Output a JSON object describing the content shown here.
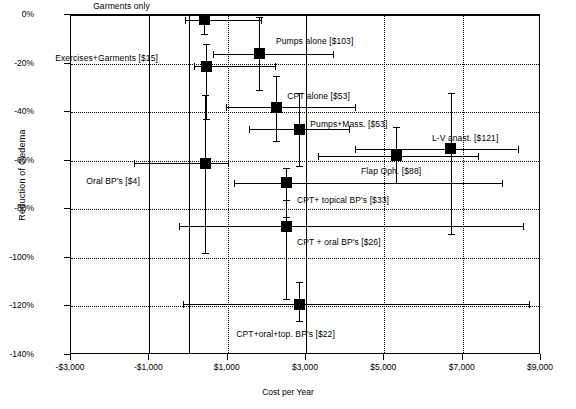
{
  "chart_data": {
    "type": "scatter",
    "title": "",
    "xlabel": "Cost per Year",
    "ylabel": "Reduction of Oedema",
    "xlim": [
      -3000,
      9000
    ],
    "ylim": [
      -140,
      0
    ],
    "grid": true,
    "legend": "none",
    "xticks": [
      "-$3,000",
      "-$1,000",
      "$1,000",
      "$3,000",
      "$5,000",
      "$7,000",
      "$9,000"
    ],
    "xtick_values": [
      -3000,
      -1000,
      1000,
      3000,
      5000,
      7000,
      9000
    ],
    "yticks": [
      "0%",
      "-20%",
      "-40%",
      "-60%",
      "-80%",
      "-100%",
      "-120%",
      "-140%"
    ],
    "ytick_values": [
      0,
      -20,
      -40,
      -60,
      -80,
      -100,
      -120,
      -140
    ],
    "points": [
      {
        "label": "Garments only",
        "cost": 400,
        "reduction": -2,
        "x_low": -100,
        "x_high": 1850,
        "y_low": -8,
        "y_high": 4
      },
      {
        "label": "Pumps alone [$103]",
        "cost": 1800,
        "reduction": -16,
        "x_low": 620,
        "x_high": 3700,
        "y_low": -31,
        "y_high": -1
      },
      {
        "label": "Exercises+Garments [$15]",
        "cost": 450,
        "reduction": -21,
        "x_low": 130,
        "x_high": 2200,
        "y_low": -43,
        "y_high": -12
      },
      {
        "label": "CPT alone [$53]",
        "cost": 2240,
        "reduction": -38,
        "x_low": 950,
        "x_high": 4250,
        "y_low": -52,
        "y_high": -25
      },
      {
        "label": "Pumps+Mass. [$53]",
        "cost": 2830,
        "reduction": -47,
        "x_low": 1550,
        "x_high": 4100,
        "y_low": -62,
        "y_high": -32
      },
      {
        "label": "L-V anast. [$121]",
        "cost": 6700,
        "reduction": -55,
        "x_low": 4250,
        "x_high": 8400,
        "y_low": -90,
        "y_high": -32
      },
      {
        "label": "Flap Oph. [$88]",
        "cost": 5300,
        "reduction": -58,
        "x_low": 3300,
        "x_high": 7400,
        "y_low": -69,
        "y_high": -46
      },
      {
        "label": "Oral BP's [$4]",
        "cost": 430,
        "reduction": -61,
        "x_low": -1400,
        "x_high": 1000,
        "y_low": -98,
        "y_high": -33
      },
      {
        "label": "CPT+ topical BP's [$33]",
        "cost": 2490,
        "reduction": -69,
        "x_low": 1150,
        "x_high": 8000,
        "y_low": -83,
        "y_high": -63
      },
      {
        "label": "CPT + oral BP's [$26]",
        "cost": 2490,
        "reduction": -87,
        "x_low": -250,
        "x_high": 8550,
        "y_low": -117,
        "y_high": -76
      },
      {
        "label": "CPT+oral+top. BP's [$22]",
        "cost": 2830,
        "reduction": -119,
        "x_low": -130,
        "x_high": 8700,
        "y_low": -126,
        "y_high": -110
      }
    ]
  },
  "labels": {
    "garments_only": "Garments only",
    "pumps_alone": "Pumps alone [$103]",
    "exercises_garments": "Exercises+Garments [$15]",
    "cpt_alone": "CPT alone [$53]",
    "pumps_mass": "Pumps+Mass. [$53]",
    "lv_anast": "L-V anast. [$121]",
    "flap_oph": "Flap Oph. [$88]",
    "oral_bps": "Oral BP's [$4]",
    "cpt_topical_bps": "CPT+ topical BP's [$33]",
    "cpt_oral_bps": "CPT + oral BP's [$26]",
    "cpt_oral_top_bps": "CPT+oral+top. BP's [$22]"
  },
  "axes": {
    "x_title": "Cost per Year",
    "y_title": "Reduction of Oedema",
    "x_ticks": [
      "-$3,000",
      "-$1,000",
      "$1,000",
      "$3,000",
      "$5,000",
      "$7,000",
      "$9,000"
    ],
    "y_ticks": [
      "0%",
      "-20%",
      "-40%",
      "-60%",
      "-80%",
      "-100%",
      "-120%",
      "-140%"
    ]
  }
}
